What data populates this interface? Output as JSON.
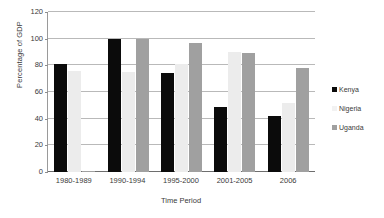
{
  "chart_data": {
    "type": "bar",
    "title": "",
    "xlabel": "Time Period",
    "ylabel": "Percentage of GDP",
    "categories": [
      "1980-1989",
      "1990-1994",
      "1995-2000",
      "2001-2005",
      "2006"
    ],
    "series": [
      {
        "name": "Kenya",
        "color": "#0b0b0b",
        "values": [
          81,
          100,
          74,
          49,
          42
        ]
      },
      {
        "name": "Nigeria",
        "color": "#ececec",
        "values": [
          76,
          75,
          81,
          90,
          52
        ]
      },
      {
        "name": "Uganda",
        "color": "#a0a0a0",
        "values": [
          1,
          100,
          97,
          89,
          78
        ]
      }
    ],
    "ylim": [
      0,
      120
    ],
    "yticks": [
      0,
      20,
      40,
      60,
      80,
      100,
      120
    ],
    "ytick_labels": [
      "0",
      "20",
      "40",
      "60",
      "80",
      "100",
      "120"
    ],
    "grid": true,
    "legend_position": "right"
  }
}
